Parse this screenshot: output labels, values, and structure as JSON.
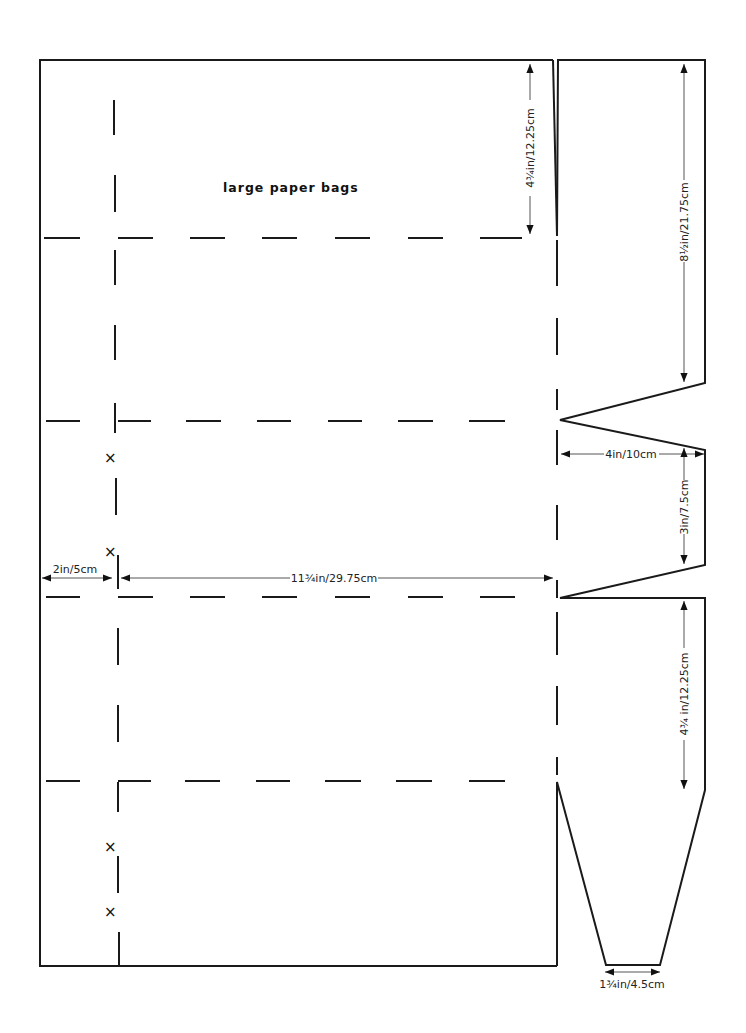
{
  "title": "large paper bags",
  "dimensions": {
    "top_left_flap": "4¾in/12.25cm",
    "right_top_panel": "8½in/21.75cm",
    "gusset_width": "4in/10cm",
    "gusset_height": "3in/7.5cm",
    "seam_allowance": "2in/5cm",
    "bag_width": "11¾in/29.75cm",
    "right_bottom_panel": "4¾ in/12.25cm",
    "base_tab": "1¾in/4.5cm"
  },
  "marks": {
    "cross": "×"
  }
}
